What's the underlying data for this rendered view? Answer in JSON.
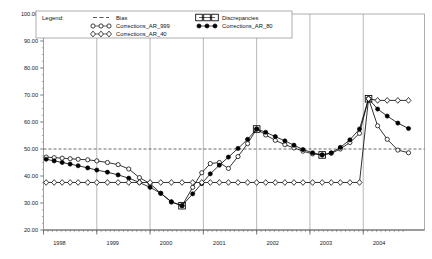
{
  "legend": {
    "title": "Legend:",
    "entries": [
      {
        "label": "Bias",
        "marker": "dashed-line",
        "color": "#555555"
      },
      {
        "label": "Corrections_AR_999",
        "marker": "open-circle",
        "color": "#000000"
      },
      {
        "label": "Corrections_AR_40",
        "marker": "open-diamond",
        "color": "#000000"
      },
      {
        "label": "Discrepancies",
        "marker": "open-square",
        "color": "#000000"
      },
      {
        "label": "Corrections_AR_80",
        "marker": "filled-circle",
        "color": "#000000"
      }
    ]
  },
  "axes": {
    "y_ticks": [
      "100.00",
      "90.00",
      "80.00",
      "70.00",
      "60.00",
      "50.00",
      "40.00",
      "30.00",
      "20.00"
    ],
    "x_ticks": [
      "1998",
      "1999",
      "2000",
      "2001",
      "2002",
      "2003",
      "2004"
    ]
  },
  "chart_data": {
    "type": "line",
    "title": "",
    "xlabel": "",
    "ylabel": "",
    "ylim": [
      20,
      100
    ],
    "xlim": [
      1997.75,
      2004.9
    ],
    "ytick_values": [
      100,
      90,
      80,
      70,
      60,
      50,
      40,
      30,
      20
    ],
    "xtick_values": [
      1998,
      1999,
      2000,
      2001,
      2002,
      2003,
      2004
    ],
    "grid": "vertical-year-gridlines",
    "legend_position": "top-inside",
    "series": [
      {
        "name": "Bias",
        "marker": "none",
        "style": "dashed",
        "constant_value": 50,
        "x": [
          1997.75,
          2004.9
        ],
        "values": [
          50,
          50
        ]
      },
      {
        "name": "Corrections_AR_999",
        "marker": "open-circle",
        "style": "solid",
        "x": [
          1997.8,
          1997.95,
          1998.1,
          1998.25,
          1998.4,
          1998.58,
          1998.75,
          1998.95,
          1999.15,
          1999.35,
          1999.55,
          1999.75,
          1999.95,
          2000.15,
          2000.35,
          2000.55,
          2000.72,
          2000.88,
          2001.05,
          2001.22,
          2001.4,
          2001.58,
          2001.75,
          2001.92,
          2002.1,
          2002.28,
          2002.45,
          2002.62,
          2002.8,
          2002.98,
          2003.15,
          2003.32,
          2003.5,
          2003.68,
          2003.85,
          2004.02,
          2004.2,
          2004.4,
          2004.6
        ],
        "values": [
          47.0,
          46.8,
          46.6,
          46.4,
          46.2,
          46.0,
          45.6,
          45.0,
          44.2,
          42.6,
          39.4,
          37.2,
          33.6,
          30.4,
          29.0,
          35.8,
          41.2,
          44.6,
          45.0,
          42.8,
          47.2,
          52.0,
          57.4,
          55.2,
          53.2,
          51.6,
          50.4,
          49.2,
          48.2,
          47.8,
          48.4,
          50.0,
          52.4,
          55.8,
          68.6,
          58.6,
          53.6,
          49.6,
          48.6
        ]
      },
      {
        "name": "Corrections_AR_80",
        "marker": "filled-circle",
        "style": "solid",
        "x": [
          1997.8,
          1997.95,
          1998.1,
          1998.25,
          1998.4,
          1998.58,
          1998.75,
          1998.95,
          1999.15,
          1999.35,
          1999.55,
          1999.75,
          1999.95,
          2000.15,
          2000.35,
          2000.55,
          2000.72,
          2000.88,
          2001.05,
          2001.22,
          2001.4,
          2001.58,
          2001.75,
          2001.92,
          2002.1,
          2002.28,
          2002.45,
          2002.62,
          2002.8,
          2002.98,
          2003.15,
          2003.32,
          2003.5,
          2003.68,
          2003.85,
          2004.02,
          2004.2,
          2004.4,
          2004.6
        ],
        "values": [
          46.2,
          45.6,
          45.0,
          44.4,
          43.8,
          43.0,
          42.2,
          41.4,
          40.4,
          39.2,
          37.6,
          35.8,
          33.6,
          30.4,
          29.0,
          33.4,
          37.2,
          40.8,
          44.0,
          47.0,
          50.2,
          53.6,
          57.4,
          56.2,
          54.6,
          53.0,
          51.4,
          49.8,
          48.6,
          47.8,
          48.6,
          50.6,
          53.4,
          57.4,
          68.6,
          64.8,
          62.2,
          59.6,
          57.6
        ]
      },
      {
        "name": "Corrections_AR_40",
        "marker": "open-diamond",
        "style": "solid",
        "x": [
          1997.8,
          1997.95,
          1998.1,
          1998.25,
          1998.4,
          1998.58,
          1998.75,
          1998.95,
          1999.15,
          1999.35,
          1999.55,
          1999.75,
          1999.95,
          2000.15,
          2000.35,
          2000.55,
          2000.72,
          2000.88,
          2001.05,
          2001.22,
          2001.4,
          2001.58,
          2001.75,
          2001.92,
          2002.1,
          2002.28,
          2002.45,
          2002.62,
          2002.8,
          2002.98,
          2003.15,
          2003.32,
          2003.5,
          2003.68,
          2003.85,
          2004.02,
          2004.2,
          2004.4,
          2004.6
        ],
        "values": [
          37.6,
          37.6,
          37.6,
          37.6,
          37.6,
          37.6,
          37.6,
          37.6,
          37.6,
          37.6,
          37.6,
          37.6,
          37.6,
          37.6,
          37.6,
          37.6,
          37.6,
          37.6,
          37.6,
          37.6,
          37.6,
          37.6,
          37.6,
          37.6,
          37.6,
          37.6,
          37.6,
          37.6,
          37.6,
          37.6,
          37.6,
          37.6,
          37.6,
          37.6,
          68.6,
          68.0,
          68.0,
          68.0,
          68.0
        ]
      },
      {
        "name": "Discrepancies",
        "marker": "open-square",
        "style": "points-only",
        "x": [
          2000.35,
          2001.75,
          2002.98,
          2003.85
        ],
        "values": [
          29.0,
          57.4,
          47.8,
          68.6
        ]
      }
    ]
  }
}
